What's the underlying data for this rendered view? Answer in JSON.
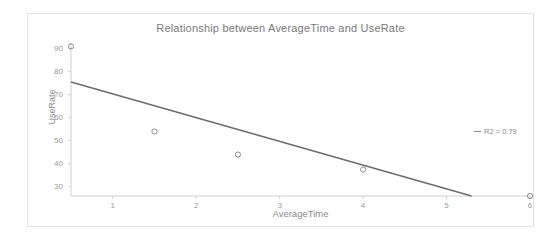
{
  "chart_data": {
    "type": "scatter",
    "title": "Relationship between AverageTime and UseRate",
    "xlabel": "AverageTime",
    "ylabel": "UseRate",
    "xlim": [
      0.5,
      6.0
    ],
    "ylim": [
      26,
      92
    ],
    "grid": false,
    "xticks": [
      "1",
      "2",
      "3",
      "4",
      "5",
      "6"
    ],
    "xtick_values": [
      1,
      2,
      3,
      4,
      5,
      6
    ],
    "yticks": [
      "30",
      "40",
      "50",
      "60",
      "70",
      "80",
      "90"
    ],
    "ytick_values": [
      30,
      40,
      50,
      60,
      70,
      80,
      90
    ],
    "series": [
      {
        "name": "UseRate",
        "marker": "open-circle",
        "color": "#8c8c8c",
        "x": [
          0.5,
          1.5,
          2.5,
          4.0,
          6.0
        ],
        "values": [
          91,
          54,
          44,
          37.5,
          26
        ]
      }
    ],
    "trendline": {
      "name": "linear fit",
      "color": "#6b6b6b",
      "x_start": 0.5,
      "y_start": 75.5,
      "x_end": 5.3,
      "y_end": 26
    },
    "legend": {
      "position": "right",
      "entries": [
        {
          "label": "R2 = 0.79",
          "swatch": "line",
          "color": "#8c8c8c"
        }
      ]
    },
    "annotations": []
  },
  "colors": {
    "frame": "#e3e3e3",
    "axis": "#d0d0d0",
    "text": "#8a8a8a",
    "title_text": "#7a7a7a",
    "marker": "#8c8c8c",
    "trendline": "#6b6b6b",
    "background": "#ffffff"
  }
}
